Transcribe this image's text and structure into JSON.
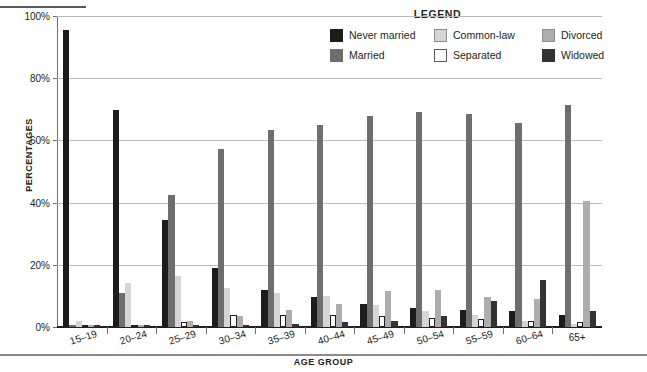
{
  "chart_data": {
    "type": "bar",
    "title": "",
    "xlabel": "AGE GROUP",
    "ylabel": "PERCENTAGES",
    "ylim": [
      0,
      100
    ],
    "yticks": [
      "0%",
      "20%",
      "40%",
      "60%",
      "80%",
      "100%"
    ],
    "ytick_values": [
      0,
      20,
      40,
      60,
      80,
      100
    ],
    "grid": true,
    "legend_title": "LEGEND",
    "legend_position": "top-right",
    "categories": [
      "15–19",
      "20–24",
      "25–29",
      "30–34",
      "35–39",
      "40–44",
      "45–49",
      "50–54",
      "55–59",
      "60–64",
      "65+"
    ],
    "series": [
      {
        "name": "Never married",
        "color": "#1c1c1c",
        "values": [
          95.5,
          69.8,
          34.5,
          19.0,
          12.0,
          9.5,
          7.5,
          6.0,
          5.5,
          5.0,
          4.0
        ]
      },
      {
        "name": "Married",
        "color": "#6e6e6e",
        "values": [
          0.8,
          11.0,
          42.5,
          57.2,
          63.5,
          65.0,
          68.0,
          69.0,
          68.5,
          65.5,
          71.5
        ]
      },
      {
        "name": "Common-law",
        "color": "#d5d5d5",
        "values": [
          1.8,
          14.0,
          16.5,
          12.5,
          11.0,
          10.0,
          7.0,
          5.0,
          4.0,
          2.0,
          1.0
        ]
      },
      {
        "name": "Separated",
        "color": "#ffffff",
        "values": [
          0.3,
          0.6,
          1.5,
          4.0,
          4.0,
          4.0,
          3.5,
          3.0,
          2.5,
          2.0,
          1.5
        ]
      },
      {
        "name": "Divorced",
        "color": "#adadad",
        "values": [
          0.2,
          0.5,
          2.0,
          3.5,
          5.5,
          7.5,
          11.5,
          12.0,
          9.5,
          9.0,
          40.5
        ]
      },
      {
        "name": "Widowed",
        "color": "#333333",
        "values": [
          0.1,
          0.3,
          0.5,
          0.8,
          1.0,
          1.5,
          2.0,
          3.5,
          8.5,
          15.0,
          5.0
        ]
      }
    ]
  },
  "legend": {
    "title": "LEGEND",
    "items": [
      {
        "label": "Never married",
        "color": "#1c1c1c",
        "border": "#1c1c1c"
      },
      {
        "label": "Common-law",
        "color": "#d5d5d5",
        "border": "#8c8c8c"
      },
      {
        "label": "Divorced",
        "color": "#adadad",
        "border": "#8c8c8c"
      },
      {
        "label": "Married",
        "color": "#6e6e6e",
        "border": "#6e6e6e"
      },
      {
        "label": "Separated",
        "color": "#ffffff",
        "border": "#58595b"
      },
      {
        "label": "Widowed",
        "color": "#333333",
        "border": "#333333"
      }
    ]
  },
  "axes": {
    "ylabel": "PERCENTAGES",
    "xlabel": "AGE GROUP"
  }
}
